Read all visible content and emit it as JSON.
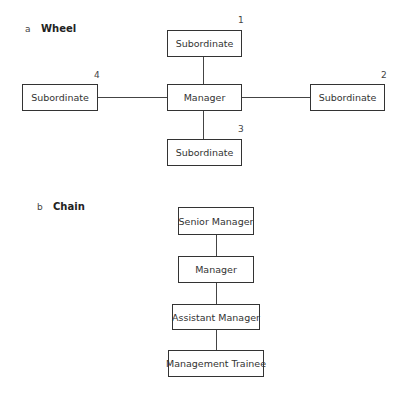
{
  "wheel": {
    "letter": "a",
    "title": "Wheel",
    "center": "Manager",
    "nodes": [
      {
        "label": "Subordinate",
        "number": "1"
      },
      {
        "label": "Subordinate",
        "number": "2"
      },
      {
        "label": "Subordinate",
        "number": "3"
      },
      {
        "label": "Subordinate",
        "number": "4"
      }
    ]
  },
  "chain": {
    "letter": "b",
    "title": "Chain",
    "nodes": [
      {
        "label": "Senior Manager"
      },
      {
        "label": "Manager"
      },
      {
        "label": "Assistant Manager"
      },
      {
        "label": "Management Trainee"
      }
    ]
  }
}
